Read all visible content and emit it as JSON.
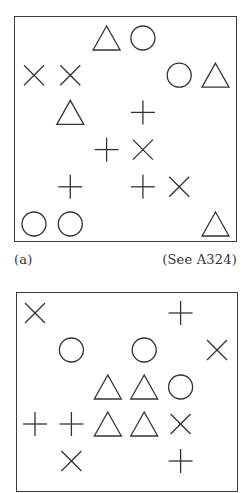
{
  "figures": [
    {
      "id": "a",
      "label": "(a)",
      "reference": "(See A324)",
      "grid": {
        "cols": 6,
        "rows": 6
      },
      "cells": [
        {
          "row": 0,
          "col": 2,
          "shape": "triangle"
        },
        {
          "row": 0,
          "col": 3,
          "shape": "circle"
        },
        {
          "row": 1,
          "col": 0,
          "shape": "cross-x"
        },
        {
          "row": 1,
          "col": 1,
          "shape": "cross-x"
        },
        {
          "row": 1,
          "col": 4,
          "shape": "circle"
        },
        {
          "row": 1,
          "col": 5,
          "shape": "triangle"
        },
        {
          "row": 2,
          "col": 1,
          "shape": "triangle"
        },
        {
          "row": 2,
          "col": 3,
          "shape": "plus"
        },
        {
          "row": 3,
          "col": 2,
          "shape": "plus"
        },
        {
          "row": 3,
          "col": 3,
          "shape": "cross-x"
        },
        {
          "row": 4,
          "col": 1,
          "shape": "plus"
        },
        {
          "row": 4,
          "col": 3,
          "shape": "plus"
        },
        {
          "row": 4,
          "col": 4,
          "shape": "cross-x"
        },
        {
          "row": 5,
          "col": 0,
          "shape": "circle"
        },
        {
          "row": 5,
          "col": 1,
          "shape": "circle"
        },
        {
          "row": 5,
          "col": 5,
          "shape": "triangle"
        }
      ]
    },
    {
      "id": "b",
      "label": "",
      "reference": "",
      "grid": {
        "cols": 6,
        "rows": 5
      },
      "cells": [
        {
          "row": 0,
          "col": 0,
          "shape": "cross-x"
        },
        {
          "row": 0,
          "col": 4,
          "shape": "plus"
        },
        {
          "row": 1,
          "col": 1,
          "shape": "circle"
        },
        {
          "row": 1,
          "col": 3,
          "shape": "circle"
        },
        {
          "row": 1,
          "col": 5,
          "shape": "cross-x"
        },
        {
          "row": 2,
          "col": 2,
          "shape": "triangle"
        },
        {
          "row": 2,
          "col": 3,
          "shape": "triangle"
        },
        {
          "row": 2,
          "col": 4,
          "shape": "circle"
        },
        {
          "row": 3,
          "col": 0,
          "shape": "plus"
        },
        {
          "row": 3,
          "col": 1,
          "shape": "plus"
        },
        {
          "row": 3,
          "col": 2,
          "shape": "triangle"
        },
        {
          "row": 3,
          "col": 3,
          "shape": "triangle"
        },
        {
          "row": 3,
          "col": 4,
          "shape": "cross-x"
        },
        {
          "row": 4,
          "col": 1,
          "shape": "cross-x"
        },
        {
          "row": 4,
          "col": 4,
          "shape": "plus"
        }
      ]
    }
  ],
  "captions": {
    "figure_a_label": "(a)",
    "figure_a_reference": "(See A324)"
  }
}
